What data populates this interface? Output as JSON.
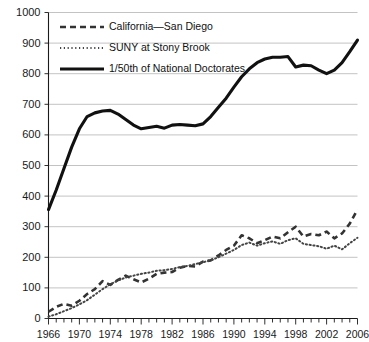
{
  "chart_data": {
    "type": "line",
    "title": "",
    "subtitle": "",
    "xlabel": "",
    "ylabel": "",
    "xlim": [
      1966,
      2006
    ],
    "ylim": [
      0,
      1000
    ],
    "grid": true,
    "legend_position": "top-left",
    "y_ticks": [
      0,
      100,
      200,
      300,
      400,
      500,
      600,
      700,
      800,
      900,
      1000
    ],
    "y_tick_labels": [
      "0",
      "100",
      "200",
      "300",
      "400",
      "500",
      "600",
      "700",
      "800",
      "900",
      "1000"
    ],
    "x_ticks_minor_step": 1,
    "x_ticks": [
      1966,
      1970,
      1974,
      1978,
      1982,
      1986,
      1990,
      1994,
      1998,
      2002,
      2006
    ],
    "x_tick_labels": [
      "1966",
      "1970",
      "1974",
      "1978",
      "1982",
      "1986",
      "1990",
      "1994",
      "1998",
      "2002",
      "2006"
    ],
    "x": [
      1966,
      1967,
      1968,
      1969,
      1970,
      1971,
      1972,
      1973,
      1974,
      1975,
      1976,
      1977,
      1978,
      1979,
      1980,
      1981,
      1982,
      1983,
      1984,
      1985,
      1986,
      1987,
      1988,
      1989,
      1990,
      1991,
      1992,
      1993,
      1994,
      1995,
      1996,
      1997,
      1998,
      1999,
      2000,
      2001,
      2002,
      2003,
      2004,
      2005,
      2006
    ],
    "series": [
      {
        "name": "California—San Diego",
        "style": "dashed",
        "color": "#333333",
        "values": [
          22,
          38,
          48,
          42,
          58,
          80,
          96,
          122,
          110,
          126,
          140,
          128,
          118,
          130,
          146,
          150,
          152,
          166,
          172,
          170,
          186,
          190,
          206,
          224,
          238,
          272,
          262,
          246,
          256,
          268,
          262,
          282,
          300,
          268,
          276,
          272,
          284,
          262,
          278,
          310,
          356
        ]
      },
      {
        "name": "SUNY at Stony Brook",
        "style": "dotted",
        "color": "#444444",
        "values": [
          6,
          14,
          24,
          34,
          46,
          60,
          78,
          96,
          112,
          124,
          134,
          140,
          146,
          150,
          156,
          158,
          162,
          168,
          172,
          178,
          184,
          190,
          200,
          212,
          224,
          240,
          248,
          238,
          246,
          252,
          244,
          256,
          262,
          244,
          240,
          236,
          228,
          238,
          226,
          246,
          264
        ]
      },
      {
        "name": "1/50th of National Doctorates",
        "style": "solid",
        "color": "#111111",
        "values": [
          356,
          420,
          490,
          560,
          620,
          660,
          672,
          678,
          680,
          668,
          650,
          632,
          620,
          624,
          628,
          622,
          632,
          634,
          632,
          630,
          636,
          660,
          690,
          720,
          756,
          790,
          816,
          836,
          848,
          854,
          854,
          856,
          822,
          828,
          826,
          812,
          800,
          812,
          836,
          872,
          910
        ]
      }
    ]
  },
  "legend": {
    "items": [
      {
        "label": "California—San Diego",
        "style": "dashed"
      },
      {
        "label": "SUNY at Stony Brook",
        "style": "dotted"
      },
      {
        "label": "1/50th of National Doctorates",
        "style": "solid"
      }
    ]
  }
}
